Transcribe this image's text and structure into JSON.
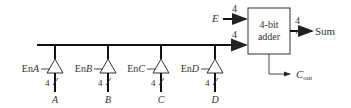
{
  "diagram": {
    "adder": {
      "line1": "4-bit",
      "line2": "adder"
    },
    "inputs": {
      "E": "E",
      "bus_width": "4",
      "E_width": "4"
    },
    "outputs": {
      "sum": "Sum",
      "sum_width": "4",
      "cout_main": "C",
      "cout_sub": "out"
    },
    "buffers": [
      {
        "enable_prefix": "En",
        "enable_var": "A",
        "input": "A",
        "width": "4"
      },
      {
        "enable_prefix": "En",
        "enable_var": "B",
        "input": "B",
        "width": "4"
      },
      {
        "enable_prefix": "En",
        "enable_var": "C",
        "input": "C",
        "width": "4"
      },
      {
        "enable_prefix": "En",
        "enable_var": "D",
        "input": "D",
        "width": "4"
      }
    ]
  }
}
